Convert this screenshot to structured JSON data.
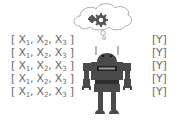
{
  "diagram": {
    "inputs": [
      {
        "open": "[ ",
        "x1": "X",
        "s1": "1",
        "x2": "X",
        "s2": "2",
        "x3": "X",
        "s3": "3",
        "close": " ]"
      },
      {
        "open": "[ ",
        "x1": "X",
        "s1": "1",
        "x2": "X",
        "s2": "2",
        "x3": "X",
        "s3": "3",
        "close": " ]"
      },
      {
        "open": "[ ",
        "x1": "X",
        "s1": "1",
        "x2": "X",
        "s2": "2",
        "x3": "X",
        "s3": "3",
        "close": " ]"
      },
      {
        "open": "[ ",
        "x1": "X",
        "s1": "1",
        "x2": "X",
        "s2": "2",
        "x3": "X",
        "s3": "3",
        "close": " ]"
      },
      {
        "open": "[ ",
        "x1": "X",
        "s1": "1",
        "x2": "X",
        "s2": "2",
        "x3": "X",
        "s3": "3",
        "close": " ]"
      }
    ],
    "sep": ", ",
    "outputs": [
      "[Y]",
      "[Y]",
      "[Y]",
      "[Y]",
      "[Y]"
    ],
    "icons": [
      "thought-cloud-icon",
      "gears-icon",
      "robot-icon"
    ],
    "colors": {
      "text": "#6a6a6a",
      "robot": "#4a4a4a",
      "cloud_stroke": "#9a9a9a"
    }
  }
}
